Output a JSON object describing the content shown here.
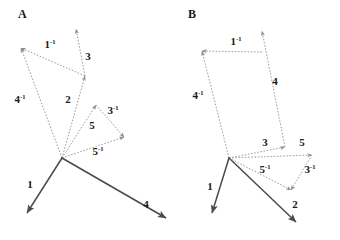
{
  "figure": {
    "background_color": "#ffffff",
    "width": 340,
    "height": 240,
    "solid_vector_color": "#4a4a4a",
    "dotted_vector_color": "#8c8c8c",
    "label_color": "#1a1a1a"
  },
  "panels": [
    {
      "id": "A",
      "letter": "A",
      "letter_pos": {
        "x": 18,
        "y": 18
      },
      "origin": {
        "x": 62,
        "y": 158
      },
      "vectors": [
        {
          "name": "1",
          "label": "1",
          "superscript": "",
          "style": "solid",
          "from": {
            "x": 62,
            "y": 158
          },
          "to": {
            "x": 27,
            "y": 213
          },
          "label_pos": {
            "x": 30,
            "y": 188
          }
        },
        {
          "name": "4",
          "label": "4",
          "superscript": "",
          "style": "solid",
          "from": {
            "x": 62,
            "y": 158
          },
          "to": {
            "x": 166,
            "y": 218
          },
          "label_pos": {
            "x": 146,
            "y": 208
          }
        },
        {
          "name": "2",
          "label": "2",
          "superscript": "",
          "style": "dotted",
          "from": {
            "x": 62,
            "y": 158
          },
          "to": {
            "x": 85,
            "y": 76
          },
          "label_pos": {
            "x": 68,
            "y": 103
          }
        },
        {
          "name": "3",
          "label": "3",
          "superscript": "",
          "style": "dotted",
          "from": {
            "x": 85,
            "y": 76
          },
          "to": {
            "x": 76,
            "y": 29
          },
          "label_pos": {
            "x": 88,
            "y": 60
          }
        },
        {
          "name": "1-inv",
          "label": "1",
          "superscript": "-1",
          "style": "dotted",
          "from": {
            "x": 85,
            "y": 76
          },
          "to": {
            "x": 21,
            "y": 48
          },
          "label_pos": {
            "x": 50,
            "y": 48
          }
        },
        {
          "name": "4-inv",
          "label": "4",
          "superscript": "-1",
          "style": "dotted",
          "from": {
            "x": 62,
            "y": 158
          },
          "to": {
            "x": 21,
            "y": 48
          },
          "label_pos": {
            "x": 20,
            "y": 103
          }
        },
        {
          "name": "5",
          "label": "5",
          "superscript": "",
          "style": "dotted",
          "from": {
            "x": 62,
            "y": 158
          },
          "to": {
            "x": 96,
            "y": 105
          },
          "label_pos": {
            "x": 92,
            "y": 129
          }
        },
        {
          "name": "3-inv",
          "label": "3",
          "superscript": "-1",
          "style": "dotted",
          "from": {
            "x": 96,
            "y": 105
          },
          "to": {
            "x": 124,
            "y": 137
          },
          "label_pos": {
            "x": 113,
            "y": 114
          }
        },
        {
          "name": "5-inv",
          "label": "5",
          "superscript": "-1",
          "style": "dotted",
          "from": {
            "x": 62,
            "y": 158
          },
          "to": {
            "x": 124,
            "y": 137
          },
          "label_pos": {
            "x": 98,
            "y": 155
          }
        }
      ]
    },
    {
      "id": "B",
      "letter": "B",
      "letter_pos": {
        "x": 188,
        "y": 18
      },
      "origin": {
        "x": 229,
        "y": 158
      },
      "vectors": [
        {
          "name": "1",
          "label": "1",
          "superscript": "",
          "style": "solid",
          "from": {
            "x": 229,
            "y": 158
          },
          "to": {
            "x": 212,
            "y": 213
          },
          "label_pos": {
            "x": 210,
            "y": 190
          }
        },
        {
          "name": "2",
          "label": "2",
          "superscript": "",
          "style": "solid",
          "from": {
            "x": 229,
            "y": 158
          },
          "to": {
            "x": 296,
            "y": 222
          },
          "label_pos": {
            "x": 295,
            "y": 208
          }
        },
        {
          "name": "3",
          "label": "3",
          "superscript": "",
          "style": "dotted",
          "from": {
            "x": 229,
            "y": 158
          },
          "to": {
            "x": 285,
            "y": 147
          },
          "label_pos": {
            "x": 265,
            "y": 146
          }
        },
        {
          "name": "4",
          "label": "4",
          "superscript": "",
          "style": "dotted",
          "from": {
            "x": 285,
            "y": 147
          },
          "to": {
            "x": 262,
            "y": 31
          },
          "label_pos": {
            "x": 275,
            "y": 85
          }
        },
        {
          "name": "1-inv",
          "label": "1",
          "superscript": "-1",
          "style": "dotted",
          "from": {
            "x": 262,
            "y": 52
          },
          "to": {
            "x": 202,
            "y": 51
          },
          "label_pos": {
            "x": 236,
            "y": 45
          }
        },
        {
          "name": "4-inv",
          "label": "4",
          "superscript": "-1",
          "style": "dotted",
          "from": {
            "x": 229,
            "y": 158
          },
          "to": {
            "x": 202,
            "y": 51
          },
          "label_pos": {
            "x": 198,
            "y": 99
          }
        },
        {
          "name": "5",
          "label": "5",
          "superscript": "",
          "style": "dotted",
          "from": {
            "x": 229,
            "y": 158
          },
          "to": {
            "x": 312,
            "y": 155
          },
          "label_pos": {
            "x": 302,
            "y": 146
          }
        },
        {
          "name": "3-inv",
          "label": "3",
          "superscript": "-1",
          "style": "dotted",
          "from": {
            "x": 312,
            "y": 155
          },
          "to": {
            "x": 291,
            "y": 190
          },
          "label_pos": {
            "x": 310,
            "y": 173
          }
        },
        {
          "name": "5-inv",
          "label": "5",
          "superscript": "-1",
          "style": "dotted",
          "from": {
            "x": 229,
            "y": 158
          },
          "to": {
            "x": 291,
            "y": 190
          },
          "label_pos": {
            "x": 265,
            "y": 173
          }
        }
      ]
    }
  ]
}
